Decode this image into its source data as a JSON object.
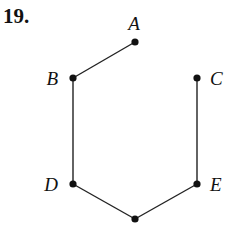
{
  "problem_number": "19.",
  "diagram": {
    "type": "hasse",
    "nodes": [
      {
        "id": "A",
        "label": "A",
        "x": 135,
        "y": 42,
        "lx": 134,
        "ly": 30,
        "anchor": "middle"
      },
      {
        "id": "B",
        "label": "B",
        "x": 73,
        "y": 78,
        "lx": 58,
        "ly": 85,
        "anchor": "end"
      },
      {
        "id": "C",
        "label": "C",
        "x": 197,
        "y": 78,
        "lx": 210,
        "ly": 85,
        "anchor": "start"
      },
      {
        "id": "D",
        "label": "D",
        "x": 73,
        "y": 184,
        "lx": 58,
        "ly": 191,
        "anchor": "end"
      },
      {
        "id": "E",
        "label": "E",
        "x": 197,
        "y": 184,
        "lx": 210,
        "ly": 191,
        "anchor": "start"
      },
      {
        "id": "F",
        "label": "",
        "x": 135,
        "y": 219,
        "lx": 135,
        "ly": 219,
        "anchor": "middle"
      }
    ],
    "edges": [
      [
        "A",
        "B"
      ],
      [
        "B",
        "D"
      ],
      [
        "D",
        "F"
      ],
      [
        "F",
        "E"
      ],
      [
        "E",
        "C"
      ]
    ]
  }
}
